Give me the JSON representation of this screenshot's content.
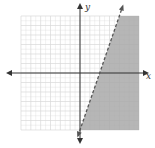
{
  "chart_data": {
    "type": "inequality-graph",
    "title": "",
    "xlabel": "x",
    "ylabel": "y",
    "grid": true,
    "xlim": [
      -6,
      6
    ],
    "ylim": [
      -6,
      6
    ],
    "grid_cells": {
      "columns": 12,
      "rows": 12
    },
    "boundary": {
      "equation": "y = 3x - 6",
      "slope": 3,
      "y_intercept": -6,
      "x_intercept": 2,
      "style": "dashed"
    },
    "inequality": "y < 3x - 6",
    "shaded_region": "right of / below the boundary line"
  },
  "axes": {
    "x_label": "x",
    "y_label": "y"
  },
  "colors": {
    "grid": "#d9d9d9",
    "axis": "#333333",
    "shade": "#a9a9a9",
    "boundary": "#555555"
  }
}
